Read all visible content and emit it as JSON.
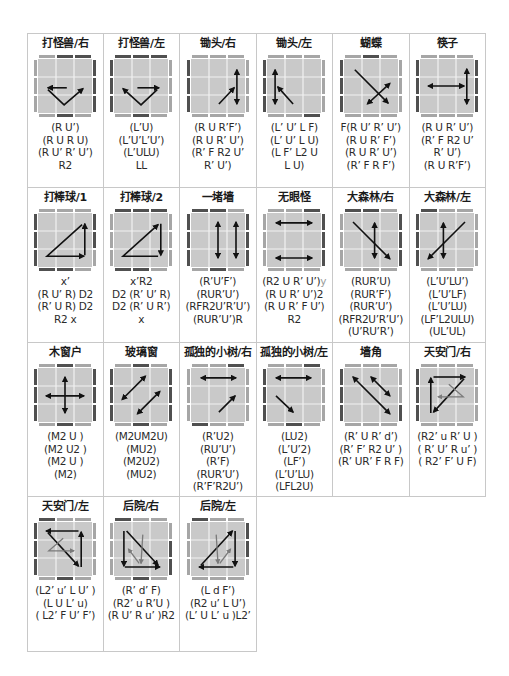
{
  "colors": {
    "face": "#c9c9c9",
    "grid_line": "#f2f2f2",
    "edge_dark": "#505050",
    "edge_light": "#a6a6a6",
    "arrow": "#111111",
    "arrow_light": "#7a7a7a",
    "border": "#c8c8c8"
  },
  "cases": [
    {
      "title": "打怪兽/右",
      "algo": [
        "(R U’)",
        "(R U R U)",
        "(R U’ R’ U’)",
        "R2"
      ],
      "edges": {
        "top": "lddl",
        "bottom": "ldl",
        "left": "lll",
        "right": "ddd"
      },
      "arrows": [
        {
          "p": [
            [
              1.6,
              1.6
            ],
            [
              0.55,
              1.6
            ]
          ],
          "h": "end"
        },
        {
          "p": [
            [
              0.55,
              1.7
            ],
            [
              1.45,
              2.55
            ],
            [
              2.5,
              1.65
            ]
          ],
          "h": "end"
        }
      ]
    },
    {
      "title": "打怪兽/左",
      "algo": [
        "(L’U)",
        "(L’U’L’U’)",
        "(L’ULU)",
        "LL"
      ],
      "edges": {
        "top": "ddd",
        "bottom": "ldl",
        "left": "ddd",
        "right": "lll"
      },
      "arrows": [
        {
          "p": [
            [
              1.3,
              1.6
            ],
            [
              2.5,
              1.6
            ]
          ],
          "h": "end"
        },
        {
          "p": [
            [
              2.4,
              1.7
            ],
            [
              1.5,
              2.55
            ],
            [
              0.5,
              1.65
            ]
          ],
          "h": "end"
        }
      ]
    },
    {
      "title": "锄头/右",
      "algo": [
        "(R U R’F’)",
        "(R U R’ U’)",
        "(R’ F R2 U’",
        "R’ U’)"
      ],
      "edges": {
        "top": "lll",
        "bottom": "lll",
        "left": "ddd",
        "right": "lll"
      },
      "arrows": [
        {
          "p": [
            [
              2.55,
              0.6
            ],
            [
              2.55,
              2.5
            ]
          ],
          "h": "both"
        },
        {
          "p": [
            [
              1.55,
              2.5
            ],
            [
              2.4,
              1.6
            ]
          ],
          "h": "end"
        }
      ]
    },
    {
      "title": "锄头/左",
      "algo": [
        "(L’ U’ L F)",
        "(L’ U’ L U)",
        "(L F’ L2 U",
        "L U)"
      ],
      "edges": {
        "top": "lll",
        "bottom": "lld",
        "left": "ddd",
        "right": "lll"
      },
      "arrows": [
        {
          "p": [
            [
              0.45,
              0.6
            ],
            [
              0.45,
              2.5
            ]
          ],
          "h": "both"
        },
        {
          "p": [
            [
              0.6,
              1.55
            ],
            [
              1.45,
              2.5
            ]
          ],
          "h": "start"
        }
      ]
    },
    {
      "title": "蝴蝶",
      "algo": [
        "F(R U’ R’ U’)",
        "(R U R’ F’)",
        "(R U R’ U’)",
        "(R’ F R F’)"
      ],
      "edges": {
        "top": "ldl",
        "bottom": "lll",
        "left": "ddd",
        "right": "lll"
      },
      "arrows": [
        {
          "p": [
            [
              0.6,
              0.6
            ],
            [
              2.45,
              2.45
            ]
          ],
          "h": "end"
        },
        {
          "p": [
            [
              1.3,
              2.5
            ],
            [
              2.55,
              1.35
            ]
          ],
          "h": "both"
        }
      ]
    },
    {
      "title": "筷子",
      "algo": [
        "(R U R’ U’)",
        "(R’ F R2 U’",
        "R’ U’)",
        "(R U R’F’)"
      ],
      "edges": {
        "top": "lll",
        "bottom": "lll",
        "left": "ddd",
        "right": "ddd"
      },
      "arrows": [
        {
          "p": [
            [
              0.45,
              1.5
            ],
            [
              2.45,
              1.5
            ]
          ],
          "h": "both"
        },
        {
          "p": [
            [
              2.6,
              0.55
            ],
            [
              2.6,
              2.5
            ]
          ],
          "h": "both"
        }
      ]
    },
    {
      "title": "打棒球/1",
      "algo": [
        "x’",
        "(R U’ R) D2",
        "(R’ U R) D2",
        "R2 x"
      ],
      "edges": {
        "top": "lll",
        "bottom": "ddl",
        "left": "ddd",
        "right": "ddl"
      },
      "arrows": [
        {
          "p": [
            [
              2.6,
              2.35
            ],
            [
              2.6,
              0.6
            ]
          ],
          "h": "end"
        },
        {
          "p": [
            [
              2.45,
              0.65
            ],
            [
              0.5,
              2.4
            ],
            [
              2.55,
              2.4
            ]
          ],
          "h": "end"
        }
      ]
    },
    {
      "title": "打棒球/2",
      "algo": [
        "x’R2",
        "D2 (R’ U’ R)",
        "D2 (R’ U R’)",
        "x"
      ],
      "edges": {
        "top": "ddd",
        "bottom": "ddl",
        "left": "lll",
        "right": "lll"
      },
      "arrows": [
        {
          "p": [
            [
              2.6,
              0.6
            ],
            [
              2.6,
              2.35
            ]
          ],
          "h": "end"
        },
        {
          "p": [
            [
              2.45,
              2.4
            ],
            [
              0.5,
              2.4
            ],
            [
              2.45,
              0.65
            ]
          ],
          "h": "end"
        }
      ]
    },
    {
      "title": "一堵墙",
      "algo": [
        "(R’U’F’)",
        "(RUR’U’)",
        "(RFR2U’R’U’)",
        "(RUR’U’)R"
      ],
      "edges": {
        "top": "ddl",
        "bottom": "ldl",
        "left": "ddd",
        "right": "ddd"
      },
      "arrows": [
        {
          "p": [
            [
              1.5,
              0.5
            ],
            [
              1.5,
              2.5
            ]
          ],
          "h": "both"
        },
        {
          "p": [
            [
              2.5,
              0.5
            ],
            [
              2.5,
              2.5
            ]
          ],
          "h": "both"
        }
      ]
    },
    {
      "title": "无眼怪",
      "algo": [
        "(R2 U R’ U’)|y",
        "(R U R’ U’)2",
        "(R U R’ F U’)",
        "R2"
      ],
      "edges": {
        "top": "lld",
        "bottom": "lll",
        "left": "lll",
        "right": "ddd"
      },
      "arrows": [
        {
          "p": [
            [
              0.5,
              0.55
            ],
            [
              2.5,
              0.55
            ]
          ],
          "h": "both"
        },
        {
          "p": [
            [
              0.5,
              2.5
            ],
            [
              2.5,
              2.5
            ]
          ],
          "h": "both"
        }
      ]
    },
    {
      "title": "大森林/右",
      "algo": [
        "(RUR’U)",
        "(RUR’F’)",
        "(RUR’U’)",
        "(RFR2U’R’U’)",
        "(U’RU’R’)"
      ],
      "edges": {
        "top": "ddl",
        "bottom": "lll",
        "left": "lll",
        "right": "ddd"
      },
      "arrows": [
        {
          "p": [
            [
              0.5,
              0.5
            ],
            [
              2.55,
              2.55
            ]
          ],
          "h": "end"
        },
        {
          "p": [
            [
              1.7,
              0.55
            ],
            [
              1.7,
              2.5
            ]
          ],
          "h": "both"
        }
      ]
    },
    {
      "title": "大森林/左",
      "algo": [
        "(L’U’LU’)",
        "(L’U’LF)",
        "(L’U’LU)",
        "(LF’L2ULU)",
        "(UL’UL)"
      ],
      "edges": {
        "top": "dll",
        "bottom": "lll",
        "left": "ddd",
        "right": "lll"
      },
      "arrows": [
        {
          "p": [
            [
              2.5,
              0.5
            ],
            [
              0.45,
              2.55
            ]
          ],
          "h": "end"
        },
        {
          "p": [
            [
              1.3,
              0.55
            ],
            [
              1.3,
              2.5
            ]
          ],
          "h": "both"
        }
      ]
    },
    {
      "title": "木窗户",
      "algo": [
        "(M2 U )",
        "(M2 U2 )",
        "(M2 U )",
        "(M2)"
      ],
      "edges": {
        "top": "ldl",
        "bottom": "ldl",
        "left": "ddd",
        "right": "ddd"
      },
      "arrows": [
        {
          "p": [
            [
              1.5,
              0.5
            ],
            [
              1.5,
              2.5
            ]
          ],
          "h": "both"
        },
        {
          "p": [
            [
              0.45,
              1.55
            ],
            [
              2.55,
              1.55
            ]
          ],
          "h": "both"
        }
      ]
    },
    {
      "title": "玻璃窗",
      "algo": [
        "(M2UM2U)",
        "(MU2)",
        "(M2U2)",
        "(MU2)"
      ],
      "edges": {
        "top": "ldl",
        "bottom": "ldl",
        "left": "ddd",
        "right": "ddd"
      },
      "arrows": [
        {
          "p": [
            [
              0.45,
              1.75
            ],
            [
              1.75,
              0.45
            ]
          ],
          "h": "both"
        },
        {
          "p": [
            [
              1.3,
              2.55
            ],
            [
              2.55,
              1.3
            ]
          ],
          "h": "both"
        }
      ]
    },
    {
      "title": "孤独的小树/右",
      "algo": [
        "(R’U2)",
        "(RU’U’)",
        "(R’F)",
        "(RUR’U’)",
        "(R’F’R2U’)"
      ],
      "edges": {
        "top": "lld",
        "bottom": "dll",
        "left": "lll",
        "right": "lll"
      },
      "arrows": [
        {
          "p": [
            [
              0.55,
              0.55
            ],
            [
              2.5,
              0.55
            ]
          ],
          "h": "both"
        },
        {
          "p": [
            [
              1.55,
              2.45
            ],
            [
              2.45,
              1.55
            ]
          ],
          "h": "end"
        }
      ]
    },
    {
      "title": "孤独的小树/左",
      "algo": [
        "(LU2)",
        "(L’U’2)",
        "(LF’)",
        "(L’U’LU)",
        "(LFL2U)"
      ],
      "edges": {
        "top": "lld",
        "bottom": "ldl",
        "left": "ddd",
        "right": "lll"
      },
      "arrows": [
        {
          "p": [
            [
              0.5,
              0.55
            ],
            [
              2.45,
              0.55
            ]
          ],
          "h": "both"
        },
        {
          "p": [
            [
              0.5,
              1.55
            ],
            [
              1.45,
              2.45
            ]
          ],
          "h": "end"
        }
      ]
    },
    {
      "title": "墙角",
      "algo": [
        "(R’ U R’ d’)",
        "(R’ F’ R2 U’ )",
        "(R’ UR’ F R F)"
      ],
      "edges": {
        "top": "lll",
        "bottom": "lll",
        "left": "ddd",
        "right": "lld"
      },
      "arrows": [
        {
          "p": [
            [
              0.5,
              0.5
            ],
            [
              2.55,
              2.55
            ]
          ],
          "h": "both"
        },
        {
          "p": [
            [
              1.5,
              0.5
            ],
            [
              2.55,
              1.55
            ]
          ],
          "h": "both"
        }
      ]
    },
    {
      "title": "天安门/右",
      "algo": [
        "(R2’ u R’ U )",
        "( R’ U’ R u’ )",
        "( R2’ F’ U F)"
      ],
      "edges": {
        "top": "lll",
        "bottom": "lll",
        "left": "ddd",
        "right": "lll"
      },
      "arrows": [
        {
          "p": [
            [
              0.6,
              2.5
            ],
            [
              0.6,
              0.55
            ]
          ],
          "h": "end"
        },
        {
          "p": [
            [
              0.75,
              0.5
            ],
            [
              2.5,
              0.5
            ]
          ],
          "h": "end"
        },
        {
          "p": [
            [
              2.45,
              0.6
            ],
            [
              0.75,
              2.45
            ]
          ],
          "h": "end"
        },
        {
          "p": [
            [
              1.6,
              0.9
            ],
            [
              2.4,
              1.6
            ],
            [
              1.0,
              1.6
            ]
          ],
          "h": "end",
          "light": true
        }
      ]
    },
    {
      "title": "天安门/左",
      "algo": [
        "(L2’ u’ L U’ )",
        "(L U L’ u)",
        "( L2’ F U’ F’)"
      ],
      "edges": {
        "top": "dll",
        "bottom": "ldl",
        "left": "ddd",
        "right": "lll"
      },
      "arrows": [
        {
          "p": [
            [
              2.4,
              2.5
            ],
            [
              2.4,
              0.55
            ]
          ],
          "h": "end"
        },
        {
          "p": [
            [
              2.25,
              0.5
            ],
            [
              0.45,
              0.5
            ]
          ],
          "h": "end"
        },
        {
          "p": [
            [
              0.55,
              0.6
            ],
            [
              2.25,
              2.45
            ]
          ],
          "h": "end"
        },
        {
          "p": [
            [
              1.4,
              0.9
            ],
            [
              0.6,
              1.6
            ],
            [
              2.0,
              1.6
            ]
          ],
          "h": "end",
          "light": true
        }
      ]
    },
    {
      "title": "后院/右",
      "algo": [
        "(R’ d’ F)",
        "(R2’ u R’U )",
        "(R U’ R u’ )R2"
      ],
      "edges": {
        "top": "dll",
        "bottom": "ldl",
        "left": "lll",
        "right": "ldd"
      },
      "arrows": [
        {
          "p": [
            [
              0.55,
              0.5
            ],
            [
              0.55,
              2.45
            ]
          ],
          "h": "end"
        },
        {
          "p": [
            [
              0.6,
              2.5
            ],
            [
              2.55,
              2.5
            ]
          ],
          "h": "end"
        },
        {
          "p": [
            [
              0.7,
              0.5
            ],
            [
              2.45,
              2.4
            ]
          ],
          "h": "end"
        },
        {
          "p": [
            [
              1.6,
              0.7
            ],
            [
              1.5,
              2.3
            ]
          ],
          "h": "end",
          "light": true
        },
        {
          "p": [
            [
              0.8,
              1.5
            ],
            [
              1.4,
              2.3
            ]
          ],
          "h": "start",
          "light": true
        }
      ]
    },
    {
      "title": "后院/左",
      "algo": [
        "(L d F’)",
        "(R2 u’ L U’)",
        "(L’ U L’ u )L2’"
      ],
      "edges": {
        "top": "dll",
        "bottom": "lll",
        "left": "lll",
        "right": "ddl"
      },
      "arrows": [
        {
          "p": [
            [
              2.45,
              0.5
            ],
            [
              2.45,
              2.45
            ]
          ],
          "h": "end"
        },
        {
          "p": [
            [
              2.35,
              2.5
            ],
            [
              0.45,
              2.5
            ]
          ],
          "h": "end"
        },
        {
          "p": [
            [
              0.55,
              2.4
            ],
            [
              2.3,
              0.5
            ]
          ],
          "h": "end"
        },
        {
          "p": [
            [
              1.4,
              0.7
            ],
            [
              1.5,
              2.3
            ]
          ],
          "h": "end",
          "light": true
        },
        {
          "p": [
            [
              2.2,
              1.5
            ],
            [
              1.6,
              2.3
            ]
          ],
          "h": "start",
          "light": true
        }
      ]
    }
  ]
}
